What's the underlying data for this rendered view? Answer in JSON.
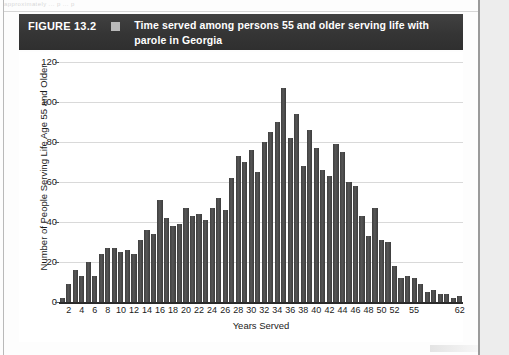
{
  "page": {
    "top_cropped_text": "approximately ... p ... p"
  },
  "figure": {
    "number_label": "FIGURE 13.2",
    "legend_marker": "legend-swatch",
    "title": "Time served among persons 55 and older serving life with parole in Georgia"
  },
  "chart_data": {
    "type": "bar",
    "title": "Time served among persons 55 and older serving life with parole in Georgia",
    "xlabel": "Years Served",
    "ylabel": "Number of People Serving Life Age 55 and Older",
    "ylim": [
      0,
      120
    ],
    "ytick_values": [
      0,
      20,
      40,
      60,
      80,
      100,
      120
    ],
    "ytick_labels": [
      "0",
      "20",
      "40",
      "60",
      "80",
      "100",
      "120"
    ],
    "grid": true,
    "legend": "none",
    "bar_color": "#4b4b4b",
    "xtick_labels": [
      "2",
      "4",
      "6",
      "8",
      "10",
      "12",
      "14",
      "16",
      "18",
      "20",
      "22",
      "24",
      "26",
      "28",
      "30",
      "32",
      "34",
      "36",
      "38",
      "40",
      "42",
      "44",
      "46",
      "48",
      "50",
      "52",
      "55",
      "62"
    ],
    "categories": [
      "1",
      "2",
      "3",
      "4",
      "5",
      "6",
      "7",
      "8",
      "9",
      "10",
      "11",
      "12",
      "13",
      "14",
      "15",
      "16",
      "17",
      "18",
      "19",
      "20",
      "21",
      "22",
      "23",
      "24",
      "25",
      "26",
      "27",
      "28",
      "29",
      "30",
      "31",
      "32",
      "33",
      "34",
      "35",
      "36",
      "37",
      "38",
      "39",
      "40",
      "41",
      "42",
      "43",
      "44",
      "45",
      "46",
      "47",
      "48",
      "49",
      "50",
      "51",
      "52",
      "53",
      "54",
      "55",
      "56",
      "57",
      "58",
      "59",
      "60",
      "61",
      "62"
    ],
    "values": [
      2,
      9,
      16,
      13,
      20,
      13,
      24,
      27,
      27,
      25,
      26,
      24,
      31,
      36,
      34,
      51,
      42,
      38,
      39,
      47,
      43,
      44,
      41,
      47,
      52,
      46,
      62,
      73,
      70,
      76,
      65,
      80,
      85,
      90,
      107,
      82,
      94,
      68,
      86,
      77,
      66,
      63,
      79,
      75,
      60,
      58,
      43,
      33,
      47,
      31,
      30,
      18,
      12,
      13,
      12,
      9,
      5,
      6,
      4,
      4,
      2,
      3
    ]
  }
}
